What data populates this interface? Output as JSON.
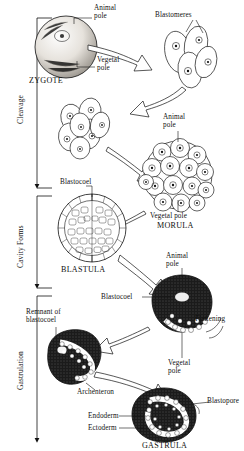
{
  "diagram": {
    "type": "biological-process-diagram",
    "stages": [
      {
        "id": "cleavage",
        "label": "Cleavage"
      },
      {
        "id": "cavity-forms",
        "label": "Cavity Forms"
      },
      {
        "id": "gastrulation",
        "label": "Gastrulation"
      }
    ],
    "structures": [
      {
        "id": "zygote",
        "caption": "ZYGOTE"
      },
      {
        "id": "blastomeres",
        "caption": "Blastomeres"
      },
      {
        "id": "morula",
        "caption": "MORULA"
      },
      {
        "id": "blastula",
        "caption": "BLASTULA"
      },
      {
        "id": "gastrula",
        "caption": "GASTRULA"
      }
    ],
    "labels": {
      "animal_pole": "Animal\npole",
      "vegetal_pole": "Vegetal\npole",
      "vegetal_pole_inline": "Vegetal pole",
      "blastomeres": "Blastomeres",
      "blastocoel": "Blastocoel",
      "remnant_of_blastocoel": "Remnant of\nblastocoel",
      "archenteron": "Archenteron",
      "flattening": "Flattening",
      "blastopore": "Blastopore",
      "endoderm": "Endoderm",
      "ectoderm": "Ectoderm"
    },
    "captions": {
      "zygote": "ZYGOTE",
      "morula": "MORULA",
      "blastula": "BLASTULA",
      "gastrula": "GASTRULA"
    },
    "colors": {
      "ink": "#111111",
      "paper": "#ffffff",
      "dark_cytoplasm": "#1b1b1b"
    }
  }
}
